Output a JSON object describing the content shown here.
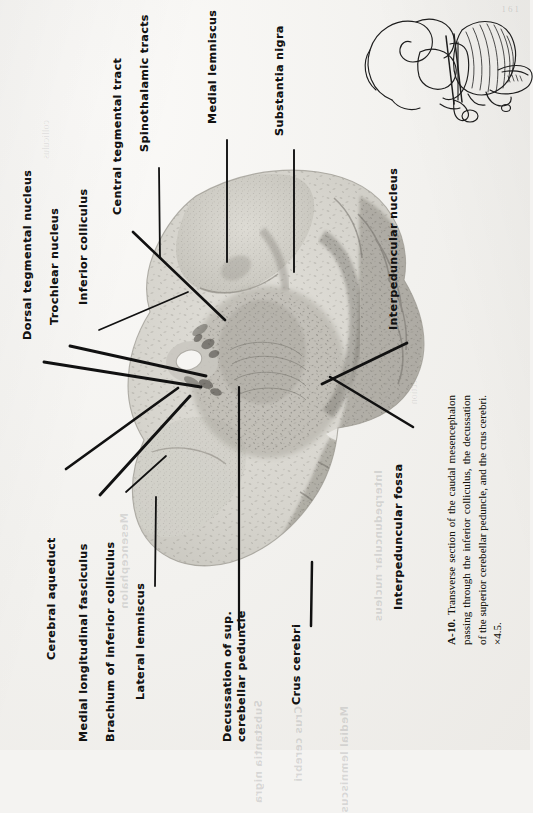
{
  "figure": {
    "id": "A-10.",
    "caption_text": "Transverse section of the caudal mesencephalon passing through the inferior colliculus, the decussation of the superior cerebellar peduncle, and the crus cerebri.",
    "magnification": "×4.5.",
    "specimen": "histological-section-caudal-mesencephalon",
    "inset": "brainstem-cerebellum-orientation-drawing"
  },
  "labels": [
    {
      "id": "dorsal-tegmental-nucleus",
      "text": "Dorsal tegmental nucleus"
    },
    {
      "id": "trochlear-nucleus",
      "text": "Trochlear nucleus"
    },
    {
      "id": "inferior-colliculus",
      "text": "Inferior colliculus"
    },
    {
      "id": "central-tegmental-tract",
      "text": "Central tegmental tract"
    },
    {
      "id": "spinothalamic-tracts",
      "text": "Spinothalamic tracts"
    },
    {
      "id": "medial-lemniscus",
      "text": "Medial lemniscus"
    },
    {
      "id": "substantia-nigra",
      "text": "Substantia nigra"
    },
    {
      "id": "interpeduncular-nucleus",
      "text": "Interpeduncular nucleus"
    },
    {
      "id": "interpeduncular-fossa",
      "text": "Interpeduncular fossa"
    },
    {
      "id": "crus-cerebri",
      "text": "Crus cerebri"
    },
    {
      "id": "decussation-sup-cerebellar-peduncle-line1",
      "text": "Decussation of sup."
    },
    {
      "id": "decussation-sup-cerebellar-peduncle-line2",
      "text": "cerebellar peduncle"
    },
    {
      "id": "lateral-lemniscus",
      "text": "Lateral lemniscus"
    },
    {
      "id": "brachium-of-inferior-colliculus",
      "text": "Brachium of inferior colliculus"
    },
    {
      "id": "medial-longitudinal-fasciculus",
      "text": "Medial longitudinal fasciculus"
    },
    {
      "id": "cerebral-aqueduct",
      "text": "Cerebral aqueduct"
    }
  ],
  "colors": {
    "paper": "#f2f1ee",
    "ink": "#121212",
    "tissue_light": "#d8d6d0",
    "tissue_dark": "#8f8d87",
    "caption_ink": "#17150f"
  },
  "page_number": "161"
}
